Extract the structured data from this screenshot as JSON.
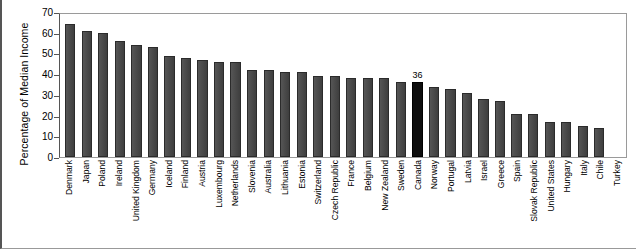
{
  "chart_data": {
    "type": "bar",
    "title": "",
    "xlabel": "",
    "ylabel": "Percentage of Median Income",
    "ylim": [
      0,
      70
    ],
    "yticks": [
      0,
      10,
      20,
      30,
      40,
      50,
      60,
      70
    ],
    "grid": false,
    "legend": false,
    "highlight_category": "Canada",
    "highlight_value_label": "36",
    "bar_color": "#474747",
    "highlight_color": "#0e0e0e",
    "categories": [
      "Denmark",
      "Japan",
      "Poland",
      "Ireland",
      "United Kingdom",
      "Germany",
      "Iceland",
      "Finland",
      "Austria",
      "Luxembourg",
      "Netherlands",
      "Slovenia",
      "Australia",
      "Lithuania",
      "Estonia",
      "Switzerland",
      "Czech Republic",
      "France",
      "Belgium",
      "New Zealand",
      "Sweden",
      "Canada",
      "Norway",
      "Portugal",
      "Latvia",
      "Israel",
      "Greece",
      "Spain",
      "Slovak Republic",
      "United States",
      "Hungary",
      "Italy",
      "Chile",
      "Turkey"
    ],
    "values": [
      64,
      61,
      60,
      56,
      54,
      53,
      49,
      48,
      47,
      46,
      46,
      42,
      42,
      41,
      41,
      39,
      39,
      38,
      38,
      38,
      36,
      36,
      34,
      33,
      31,
      28,
      27,
      21,
      21,
      17,
      17,
      15,
      14,
      0
    ],
    "value_labels": [
      "",
      "",
      "",
      "",
      "",
      "",
      "",
      "",
      "",
      "",
      "",
      "",
      "",
      "",
      "",
      "",
      "",
      "",
      "",
      "",
      "",
      "36",
      "",
      "",
      "",
      "",
      "",
      "",
      "",
      "",
      "",
      "",
      "",
      ""
    ]
  }
}
